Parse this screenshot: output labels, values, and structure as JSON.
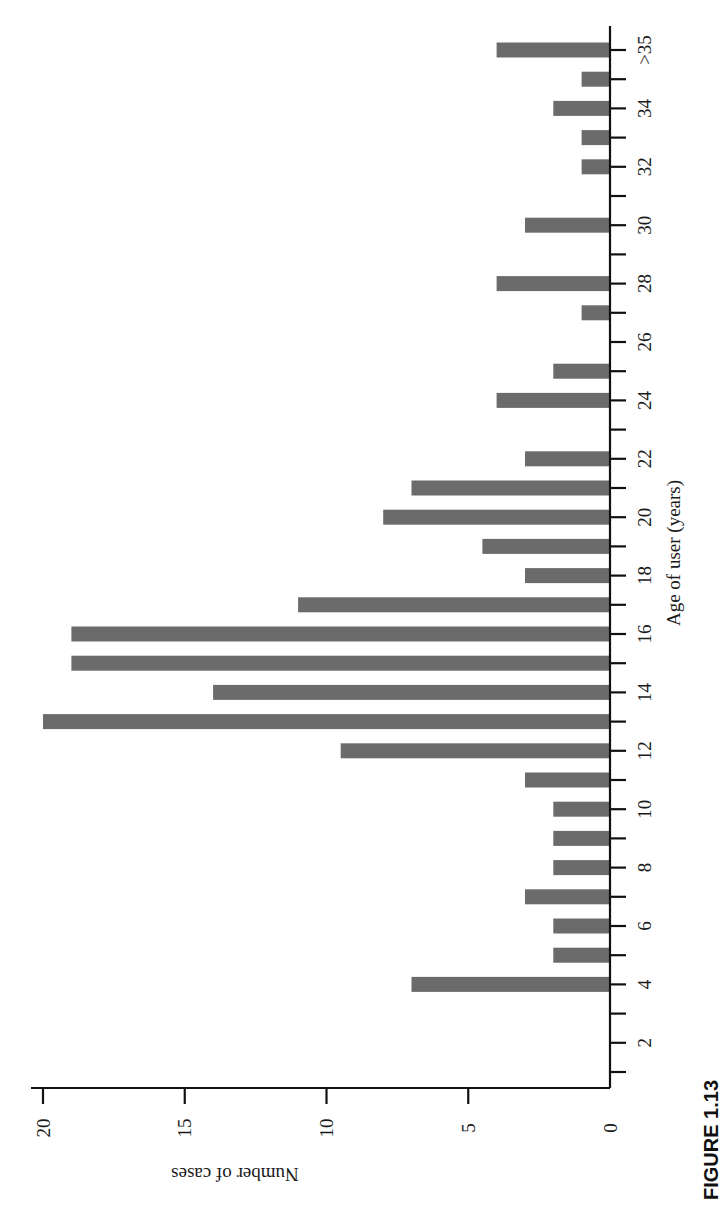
{
  "chart_data": {
    "type": "bar",
    "orientation": "rotated 90 degrees clockwise (page printed sideways)",
    "title": "",
    "caption": "FIGURE 1.13",
    "xlabel": "Age of user (years)",
    "ylabel": "Number of cases",
    "categories": [
      "1",
      "2",
      "3",
      "4",
      "5",
      "6",
      "7",
      "8",
      "9",
      "10",
      "11",
      "12",
      "13",
      "14",
      "15",
      "16",
      "17",
      "18",
      "19",
      "20",
      "21",
      "22",
      "23",
      "24",
      "25",
      "26",
      "27",
      "28",
      "29",
      "30",
      "31",
      "32",
      "33",
      "34",
      "35",
      ">35"
    ],
    "values": [
      0,
      0,
      0,
      7,
      2,
      2,
      3,
      2,
      2,
      2,
      3,
      9.5,
      20,
      14,
      19,
      19,
      11,
      3,
      4.5,
      8,
      7,
      3,
      0,
      4,
      2,
      0,
      1,
      4,
      0,
      3,
      0,
      1,
      1,
      2,
      1,
      4
    ],
    "x_tick_labels": [
      "2",
      "4",
      "6",
      "8",
      "10",
      "12",
      "14",
      "16",
      "18",
      "20",
      "22",
      "24",
      "26",
      "28",
      "30",
      "32",
      "34",
      ">35"
    ],
    "y_ticks": [
      0,
      5,
      10,
      15,
      20
    ],
    "ylim": [
      0,
      20
    ],
    "grid": false,
    "legend": null,
    "bar_color": "#6b6b6b"
  }
}
